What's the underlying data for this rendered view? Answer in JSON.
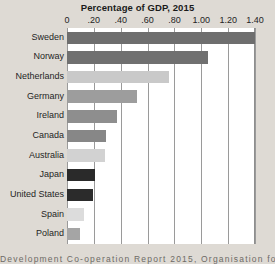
{
  "chart_data": {
    "type": "bar",
    "orientation": "horizontal",
    "title": "Percentage of GDP, 2015",
    "xlabel": "",
    "ylabel": "",
    "xlim": [
      0,
      1.4
    ],
    "grid": true,
    "legend": null,
    "categories": [
      "Sweden",
      "Norway",
      "Netherlands",
      "Germany",
      "Ireland",
      "Canada",
      "Australia",
      "Japan",
      "United States",
      "Spain",
      "Poland"
    ],
    "values": [
      1.4,
      1.05,
      0.76,
      0.52,
      0.37,
      0.29,
      0.28,
      0.21,
      0.19,
      0.13,
      0.1
    ],
    "bar_colors": [
      "#6e6e6e",
      "#707070",
      "#c9c9c9",
      "#9d9d9d",
      "#8e8e8e",
      "#878787",
      "#d2d2d2",
      "#2a2a2a",
      "#2b2b2b",
      "#dcdcdc",
      "#a5a5a5"
    ],
    "xticks": [
      0,
      0.2,
      0.4,
      0.6,
      0.8,
      1.0,
      1.2,
      1.4
    ],
    "xtick_labels": [
      "0",
      ".20",
      ".40",
      ".60",
      ".80",
      "1.00",
      "1.20",
      "1.40"
    ]
  },
  "figure": {
    "background_color": "#dedad4",
    "plot_background_color": "#ffffff",
    "gridline_color": "#9a9a9a"
  },
  "source": {
    "caption": "Development Co-operation Report 2015, Organisation fo"
  }
}
